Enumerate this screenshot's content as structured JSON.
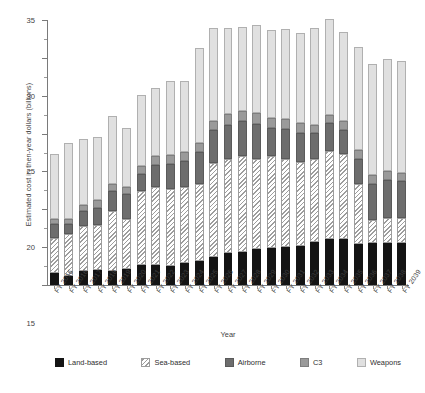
{
  "chart_data": {
    "type": "bar",
    "stacked": true,
    "title": "",
    "xlabel": "Year",
    "ylabel": "Estimated cost in then-year dollars (billions)",
    "ylim": [
      0,
      35
    ],
    "yticks": [
      0,
      5,
      10,
      15,
      20,
      25,
      30,
      35
    ],
    "grid": false,
    "legend_position": "bottom",
    "categories": [
      "FY 2015",
      "FY 2016",
      "FY 2017",
      "FY 2018",
      "FY 2019",
      "FY 2020",
      "FY 2021",
      "FY 2022",
      "FY 2023",
      "FY 2024",
      "FY 2025",
      "FY 2026",
      "FY 2027",
      "FY 2028",
      "FY 2029",
      "FY 2030",
      "FY 2031",
      "FY 2032",
      "FY 2033",
      "FY 2034",
      "FY 2035",
      "FY 2036",
      "FY 2037",
      "FY 2038",
      "FY 2039"
    ],
    "series": [
      {
        "name": "Land-based",
        "color": "#141414",
        "values": [
          1.6,
          1.2,
          1.9,
          2.0,
          1.9,
          2.1,
          2.7,
          2.6,
          2.5,
          2.9,
          3.2,
          3.7,
          4.2,
          4.4,
          4.8,
          4.9,
          5.0,
          5.1,
          5.7,
          6.1,
          6.1,
          5.4,
          5.5,
          5.6,
          5.5
        ]
      },
      {
        "name": "Sea-based",
        "color": "#ffffff",
        "pattern": "diagonal-hatch",
        "values": [
          4.6,
          5.5,
          5.9,
          5.9,
          7.9,
          6.6,
          9.7,
          10.3,
          10.2,
          10.1,
          10.2,
          12.4,
          12.4,
          12.7,
          11.9,
          12.1,
          11.6,
          11.1,
          10.9,
          11.6,
          11.2,
          8.0,
          3.1,
          3.3,
          3.3
        ]
      },
      {
        "name": "Airborne",
        "color": "#6d6d6d",
        "values": [
          1.8,
          1.4,
          2.0,
          2.3,
          2.6,
          3.3,
          2.3,
          3.0,
          3.3,
          3.4,
          4.2,
          4.4,
          4.6,
          4.5,
          4.6,
          3.8,
          4.0,
          3.9,
          3.5,
          3.7,
          3.2,
          3.3,
          4.8,
          5.0,
          4.9
        ]
      },
      {
        "name": "C3",
        "color": "#9a9a9a",
        "values": [
          0.7,
          0.6,
          0.8,
          1.0,
          1.0,
          0.9,
          1.0,
          1.1,
          1.2,
          1.2,
          1.1,
          1.2,
          1.4,
          1.4,
          1.4,
          1.3,
          1.3,
          1.3,
          1.1,
          1.1,
          1.2,
          1.2,
          1.1,
          1.1,
          1.1
        ]
      },
      {
        "name": "Weapons",
        "color": "#e0e0e0",
        "values": [
          8.6,
          10.1,
          8.7,
          8.4,
          8.9,
          7.9,
          9.4,
          9.0,
          9.7,
          9.3,
          12.6,
          12.2,
          11.3,
          11.1,
          11.6,
          11.6,
          11.9,
          11.9,
          12.7,
          12.6,
          11.7,
          13.6,
          14.7,
          14.9,
          14.8
        ]
      }
    ],
    "totals": [
      17.3,
      18.8,
      19.3,
      19.6,
      22.3,
      20.8,
      25.1,
      26.0,
      26.9,
      26.9,
      31.3,
      33.9,
      33.9,
      34.1,
      34.3,
      33.7,
      33.8,
      33.3,
      33.9,
      35.1,
      33.4,
      31.5,
      29.2,
      29.9,
      29.6
    ]
  },
  "legend": {
    "items": [
      {
        "label": "Land-based"
      },
      {
        "label": "Sea-based"
      },
      {
        "label": "Airborne"
      },
      {
        "label": "C3"
      },
      {
        "label": "Weapons"
      }
    ]
  }
}
